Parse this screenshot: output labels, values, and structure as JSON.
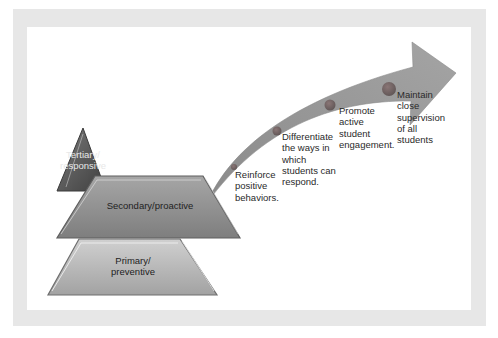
{
  "diagram": {
    "type": "tiered-pyramid-with-growth-arrow",
    "colors": {
      "frame": "#e7e7e7",
      "background": "#ffffff",
      "tertiary": "#5a5a5a",
      "secondary": "#8f8f8f",
      "primary": "#b4b4b4",
      "arrow": "#9a9a9a",
      "markers": "#777777"
    },
    "tiers": [
      {
        "id": "tertiary",
        "label": "Tertiary/\nresponsive"
      },
      {
        "id": "secondary",
        "label": "Secondary/proactive"
      },
      {
        "id": "primary",
        "label": "Primary/\npreventive"
      }
    ],
    "arrow_steps": [
      {
        "label": "Reinforce\npositive\nbehaviors."
      },
      {
        "label": "Differentiate\nthe ways in\nwhich\nstudents can\nrespond."
      },
      {
        "label": "Promote\nactive\nstudent\nengagement."
      },
      {
        "label": "Maintain\nclose\nsupervision\nof all\nstudents"
      }
    ]
  }
}
